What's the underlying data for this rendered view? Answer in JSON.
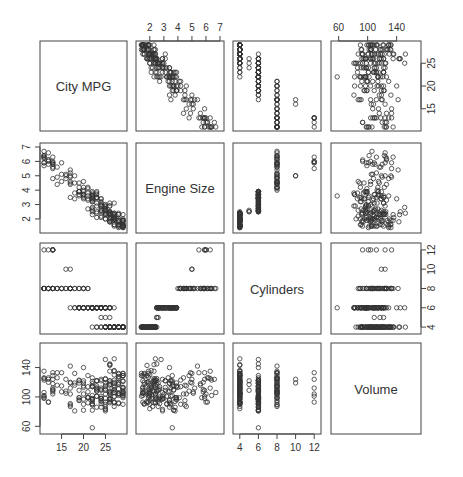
{
  "chart_data": {
    "type": "scatter",
    "subtype": "scatterplot-matrix",
    "title": "",
    "variables": [
      "City MPG",
      "Engine Size",
      "Cylinders",
      "Volume"
    ],
    "ranges": {
      "City MPG": [
        11,
        29
      ],
      "Engine Size": [
        1.3,
        7.0
      ],
      "Cylinders": [
        3.7,
        12.3
      ],
      "Volume": [
        55,
        168
      ]
    },
    "ticks": {
      "City MPG": [
        15,
        20,
        25
      ],
      "Engine Size": [
        2,
        3,
        4,
        5,
        6,
        7
      ],
      "Cylinders": [
        4,
        6,
        8,
        10,
        12
      ],
      "Volume": [
        60,
        100,
        140
      ]
    },
    "axis_placement": {
      "top": [
        "Engine Size",
        "Volume"
      ],
      "bottom": [
        "City MPG",
        "Cylinders"
      ],
      "left": [
        "Engine Size",
        "Volume"
      ],
      "right": [
        "City MPG",
        "Cylinders"
      ]
    },
    "marker": "open-circle",
    "marker_color": "#333333",
    "grid": false,
    "legend": "none",
    "n_points": 200,
    "relationships": {
      "CityMPG_vs_EngineSize": "strong negative",
      "CityMPG_vs_Cylinders": "negative, discrete cylinder levels 4,5,6,8,10,12",
      "EngineSize_vs_Cylinders": "strong positive",
      "Volume_vs_others": "weak / no clear relation, centered near 110"
    }
  }
}
